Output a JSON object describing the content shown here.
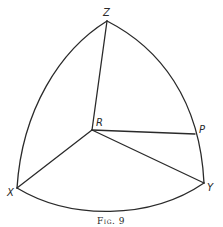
{
  "figure": {
    "caption": "Fig. 9",
    "vertices": {
      "Z": {
        "label": "Z",
        "x": 107,
        "y": 21
      },
      "R": {
        "label": "R",
        "x": 92,
        "y": 130
      },
      "P": {
        "label": "P",
        "x": 195,
        "y": 134
      },
      "X": {
        "label": "X",
        "x": 17,
        "y": 188
      },
      "Y": {
        "label": "Y",
        "x": 204,
        "y": 183
      }
    },
    "edges": [
      {
        "from": "Z",
        "to": "X",
        "type": "arc"
      },
      {
        "from": "Z",
        "to": "Y",
        "type": "arc",
        "via": "P"
      },
      {
        "from": "X",
        "to": "Y",
        "type": "arc"
      },
      {
        "from": "Z",
        "to": "R",
        "type": "line"
      },
      {
        "from": "R",
        "to": "X",
        "type": "line"
      },
      {
        "from": "R",
        "to": "Y",
        "type": "line"
      },
      {
        "from": "R",
        "to": "P",
        "type": "line"
      }
    ],
    "stroke_color": "#2a2a2a",
    "background_color": "#ffffff"
  }
}
